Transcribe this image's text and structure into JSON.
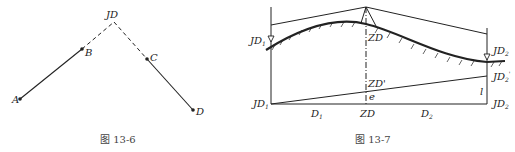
{
  "figure_left": {
    "caption": "图 13-6",
    "points": {
      "JD": "JD",
      "A": "A",
      "B": "B",
      "C": "C",
      "D": "D"
    }
  },
  "figure_right": {
    "caption": "图 13-7",
    "labels": {
      "jd1_top": "JD",
      "jd1_top_sub": "1",
      "jd2_top": "JD",
      "jd2_top_sub": "2",
      "zd_top": "ZD",
      "zd_prime": "ZD'",
      "e": "e",
      "jd2_prime": "JD",
      "jd2_prime_sub": "2",
      "jd2_prime_sup": "'",
      "l": "l",
      "jd1_bottom": "JD",
      "jd1_bottom_sub": "1",
      "jd2_bottom": "JD",
      "jd2_bottom_sub": "2",
      "zd_bottom": "ZD",
      "d1": "D",
      "d1_sub": "1",
      "d2": "D",
      "d2_sub": "2"
    }
  },
  "colors": {
    "line": "#222222",
    "caption": "#444444"
  }
}
